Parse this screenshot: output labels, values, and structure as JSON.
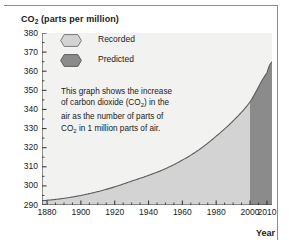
{
  "figure": {
    "background": "#ffffff",
    "frame_color": "#8d8d8d"
  },
  "axes": {
    "y_title_main": "CO",
    "y_title_sub": "2",
    "y_title_rest": " (parts per million)",
    "x_title": "Year"
  },
  "legend": {
    "items": [
      {
        "label": "Recorded",
        "color": "#d3d3d3",
        "swatch": "hexagon-swatch"
      },
      {
        "label": "Predicted",
        "color": "#8b8b8b",
        "swatch": "hexagon-swatch"
      }
    ]
  },
  "annotation": {
    "line1": "This graph shows the increase",
    "line2_a": "of carbon dioxide (CO",
    "line2_sub": "2",
    "line2_b": ") in the",
    "line3": "air as the number of parts of",
    "line4_a": "CO",
    "line4_sub": "2",
    "line4_b": " in 1 million parts of air."
  },
  "chart_data": {
    "type": "area",
    "title": "",
    "subtitle": "",
    "xlabel": "Year",
    "ylabel": "CO2 (parts per million)",
    "xlim": [
      1877,
      2013
    ],
    "ylim": [
      290,
      380
    ],
    "grid": false,
    "legend_position": "inside-top-left",
    "x_ticks": [
      1880,
      1900,
      1920,
      1940,
      1960,
      1980,
      2000,
      2010
    ],
    "x_tick_labels": [
      "1880",
      "1900",
      "1920",
      "1940",
      "1960",
      "1980",
      "2000",
      "2010"
    ],
    "x_minor_tick_interval": 5,
    "y_ticks": [
      290,
      300,
      310,
      320,
      330,
      340,
      350,
      360,
      370,
      380
    ],
    "y_tick_labels": [
      "290",
      "300",
      "310",
      "320",
      "330",
      "340",
      "350",
      "360",
      "370",
      "380"
    ],
    "y_minor_tick_interval": 5,
    "series": [
      {
        "name": "Recorded",
        "color": "#d3d3d3",
        "x_range": [
          1877,
          2000
        ],
        "note": "measured carbon dioxide concentration"
      },
      {
        "name": "Predicted",
        "color": "#8b8b8b",
        "x_range": [
          2000,
          2013
        ],
        "note": "projected carbon dioxide concentration"
      }
    ],
    "split_year": 2000,
    "x": [
      1877,
      1880,
      1890,
      1900,
      1910,
      1920,
      1930,
      1940,
      1950,
      1960,
      1970,
      1980,
      1990,
      2000,
      2010,
      2013
    ],
    "y": [
      292.3,
      292.5,
      293.5,
      295.0,
      297.0,
      299.5,
      302.5,
      305.5,
      309.0,
      313.5,
      319.0,
      326.0,
      334.0,
      344.0,
      359.0,
      365.0
    ]
  }
}
